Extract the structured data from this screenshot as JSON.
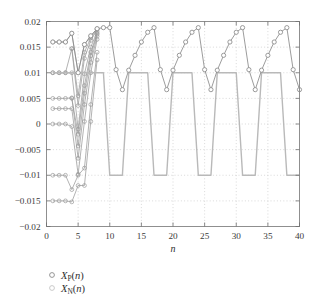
{
  "chart_data": {
    "type": "line",
    "title": "",
    "xlabel": "n",
    "ylabel": "",
    "xlim": [
      0,
      40
    ],
    "ylim": [
      -0.02,
      0.02
    ],
    "grid": true,
    "grid_style": "dotted",
    "xticks": [
      0,
      5,
      10,
      15,
      20,
      25,
      30,
      35,
      40
    ],
    "xticklabels": [
      "0",
      "5",
      "10",
      "15",
      "20",
      "25",
      "30",
      "35",
      "40"
    ],
    "yticks": [
      -0.02,
      -0.015,
      -0.01,
      -0.005,
      0,
      0.005,
      0.01,
      0.015,
      0.02
    ],
    "yticklabels": [
      "-0.02",
      "-0.015",
      "-0.01",
      "-0.005",
      "0",
      "0.005",
      "0.01",
      "0.015",
      "0.02"
    ],
    "legend_position": "below-left",
    "legend": [
      {
        "name": "X_P(n)",
        "marker": "circle-open",
        "color": "#8a8a8a"
      },
      {
        "name": "X_N(n)",
        "marker": "circle-open",
        "color": "#b9b9b9"
      }
    ],
    "series": [
      {
        "name": "X_P(n)",
        "role": "main-marked",
        "color": "#8a8a8a",
        "marker": "circle-open",
        "x": [
          1,
          2,
          3,
          4,
          5,
          6,
          7,
          8,
          9,
          10,
          11,
          12,
          13,
          14,
          15,
          16,
          17,
          18,
          19,
          20,
          21,
          22,
          23,
          24,
          25,
          26,
          27,
          28,
          29,
          30,
          31,
          32,
          33,
          34,
          35,
          36,
          37,
          38,
          39,
          40
        ],
        "values": [
          0.016,
          0.016,
          0.016,
          0.0177,
          0.01,
          0.0155,
          0.0172,
          0.0186,
          0.0188,
          0.0188,
          0.0106,
          0.0067,
          0.0105,
          0.0134,
          0.016,
          0.0179,
          0.0188,
          0.0106,
          0.0067,
          0.0105,
          0.0134,
          0.016,
          0.0179,
          0.0188,
          0.0106,
          0.0067,
          0.0105,
          0.0134,
          0.016,
          0.0179,
          0.0188,
          0.0106,
          0.0067,
          0.0105,
          0.0134,
          0.016,
          0.0179,
          0.0188,
          0.0106,
          0.0067
        ]
      },
      {
        "name": "X_N(n)",
        "role": "trapezoid-wave",
        "color": "#b9b9b9",
        "marker": "none",
        "x": [
          1,
          2,
          3,
          4,
          5,
          6,
          7,
          8,
          9,
          10,
          11,
          12,
          13,
          14,
          15,
          16,
          17,
          18,
          19,
          20,
          21,
          22,
          23,
          24,
          25,
          26,
          27,
          28,
          29,
          30,
          31,
          32,
          33,
          34,
          35,
          36,
          37,
          38,
          39,
          40
        ],
        "values": [
          0.01,
          0.01,
          0.01,
          0.01,
          0.01,
          0.01,
          0.01,
          0.01,
          0.01,
          -0.01,
          -0.01,
          -0.01,
          0.01,
          0.01,
          0.01,
          0.01,
          -0.01,
          -0.01,
          -0.01,
          0.01,
          0.01,
          0.01,
          0.01,
          -0.01,
          -0.01,
          -0.01,
          0.01,
          0.01,
          0.01,
          0.01,
          -0.01,
          -0.01,
          -0.01,
          0.01,
          0.01,
          0.01,
          0.01,
          -0.01,
          -0.01,
          -0.01
        ]
      }
    ],
    "transient_trajectories": [
      {
        "start_level": 0.016,
        "x": [
          1,
          2,
          3,
          4,
          5,
          6,
          7,
          8
        ],
        "values": [
          0.016,
          0.016,
          0.016,
          0.0177,
          0.01,
          0.0155,
          0.0172,
          0.0186
        ]
      },
      {
        "start_level": 0.01,
        "x": [
          1,
          2,
          3,
          4,
          5,
          6,
          7,
          8
        ],
        "values": [
          0.01,
          0.01,
          0.01,
          0.0147,
          0.0036,
          0.0128,
          0.0163,
          0.0184
        ]
      },
      {
        "start_level": 0.01,
        "x": [
          1,
          2,
          3,
          4,
          5,
          6,
          7,
          8
        ],
        "values": [
          0.01,
          0.01,
          0.01,
          0.01,
          -0.001,
          0.0098,
          0.015,
          0.018
        ]
      },
      {
        "start_level": 0.005,
        "x": [
          1,
          2,
          3,
          4,
          5,
          6,
          7,
          8
        ],
        "values": [
          0.005,
          0.005,
          0.005,
          0.0051,
          -0.0043,
          0.006,
          0.0133,
          0.0175
        ]
      },
      {
        "start_level": 0.003,
        "x": [
          1,
          2,
          3,
          4,
          5,
          6,
          7,
          8
        ],
        "values": [
          0.003,
          0.003,
          0.003,
          0.003,
          -0.0067,
          0.0038,
          0.012,
          0.0171
        ]
      },
      {
        "start_level": 0.0,
        "x": [
          1,
          2,
          3,
          4,
          5,
          6,
          7,
          8
        ],
        "values": [
          0.0,
          0.0,
          0.0,
          -0.0005,
          -0.0098,
          0.0005,
          0.01,
          0.0165
        ]
      },
      {
        "start_level": -0.01,
        "x": [
          1,
          2,
          3,
          4,
          5,
          6,
          7,
          8
        ],
        "values": [
          -0.01,
          -0.01,
          -0.01,
          -0.0128,
          -0.01,
          -0.0086,
          0.0038,
          0.014
        ]
      },
      {
        "start_level": -0.015,
        "x": [
          1,
          2,
          3,
          4,
          5,
          6,
          7,
          8
        ],
        "values": [
          -0.015,
          -0.015,
          -0.015,
          -0.0152,
          -0.012,
          -0.012,
          0.0005,
          0.0125
        ]
      },
      {
        "start_level": 0.0147,
        "x": [
          4,
          5,
          6,
          7,
          8
        ],
        "values": [
          0.0147,
          0.0055,
          0.014,
          0.0168,
          0.0185
        ]
      },
      {
        "start_level": 0.005,
        "x": [
          4,
          5,
          6,
          7,
          8
        ],
        "values": [
          0.005,
          -0.002,
          0.0075,
          0.014,
          0.0177
        ]
      }
    ]
  },
  "legend": {
    "items": [
      {
        "base": "X",
        "sub": "P",
        "suffix": "(n)"
      },
      {
        "base": "X",
        "sub": "N",
        "suffix": "(n)"
      }
    ]
  }
}
